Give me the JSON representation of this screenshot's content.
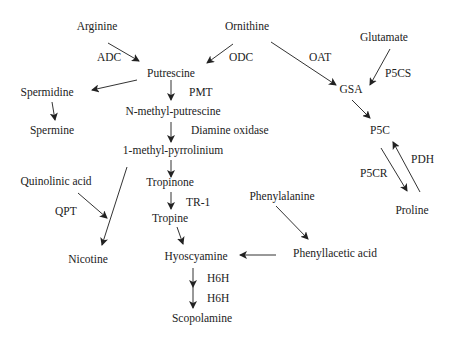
{
  "diagram": {
    "type": "metabolic-pathway",
    "colors": {
      "text": "#222222",
      "arrow": "#333333",
      "background": "#ffffff"
    },
    "nodes": {
      "arginine": "Arginine",
      "ornithine": "Ornithine",
      "glutamate": "Glutamate",
      "putrescine": "Putrescine",
      "spermidine": "Spermidine",
      "spermine": "Spermine",
      "n_methyl_putrescine": "N-methyl-putrescine",
      "methyl_pyrrolinium": "1-methyl-pyrrolinium",
      "quinolinic_acid": "Quinolinic acid",
      "tropinone": "Tropinone",
      "tropine": "Tropine",
      "nicotine": "Nicotine",
      "hyoscyamine": "Hyoscyamine",
      "scopolamine": "Scopolamine",
      "phenylalanine": "Phenylalanine",
      "phenyllacetic_acid": "Phenyllacetic acid",
      "gsa": "GSA",
      "p5c": "P5C",
      "proline": "Proline"
    },
    "enzymes": {
      "adc": "ADC",
      "odc": "ODC",
      "oat": "OAT",
      "p5cs": "P5CS",
      "pmt": "PMT",
      "diamine_oxidase": "Diamine oxidase",
      "tr1": "TR-1",
      "qpt": "QPT",
      "h6h_1": "H6H",
      "h6h_2": "H6H",
      "p5cr": "P5CR",
      "pdh": "PDH"
    },
    "edges": [
      {
        "from": "Arginine",
        "to": "Putrescine",
        "enzyme": "ADC"
      },
      {
        "from": "Ornithine",
        "to": "Putrescine",
        "enzyme": "ODC"
      },
      {
        "from": "Ornithine",
        "to": "GSA",
        "enzyme": "OAT"
      },
      {
        "from": "Glutamate",
        "to": "GSA",
        "enzyme": "P5CS"
      },
      {
        "from": "Putrescine",
        "to": "Spermidine",
        "enzyme": ""
      },
      {
        "from": "Spermidine",
        "to": "Spermine",
        "enzyme": ""
      },
      {
        "from": "Putrescine",
        "to": "N-methyl-putrescine",
        "enzyme": "PMT"
      },
      {
        "from": "N-methyl-putrescine",
        "to": "1-methyl-pyrrolinium",
        "enzyme": "Diamine oxidase"
      },
      {
        "from": "1-methyl-pyrrolinium",
        "to": "Tropinone",
        "enzyme": ""
      },
      {
        "from": "1-methyl-pyrrolinium",
        "to": "Nicotine",
        "enzyme": ""
      },
      {
        "from": "Quinolinic acid",
        "to": "Nicotine",
        "enzyme": "QPT"
      },
      {
        "from": "Tropinone",
        "to": "Tropine",
        "enzyme": "TR-1"
      },
      {
        "from": "Tropine",
        "to": "Hyoscyamine",
        "enzyme": ""
      },
      {
        "from": "Phenylalanine",
        "to": "Phenyllacetic acid",
        "enzyme": ""
      },
      {
        "from": "Phenyllacetic acid",
        "to": "Hyoscyamine",
        "enzyme": ""
      },
      {
        "from": "Hyoscyamine",
        "to": "Scopolamine",
        "enzyme": "H6H"
      },
      {
        "from": "GSA",
        "to": "P5C",
        "enzyme": ""
      },
      {
        "from": "P5C",
        "to": "Proline",
        "enzyme": "P5CR"
      },
      {
        "from": "Proline",
        "to": "P5C",
        "enzyme": "PDH"
      }
    ]
  }
}
